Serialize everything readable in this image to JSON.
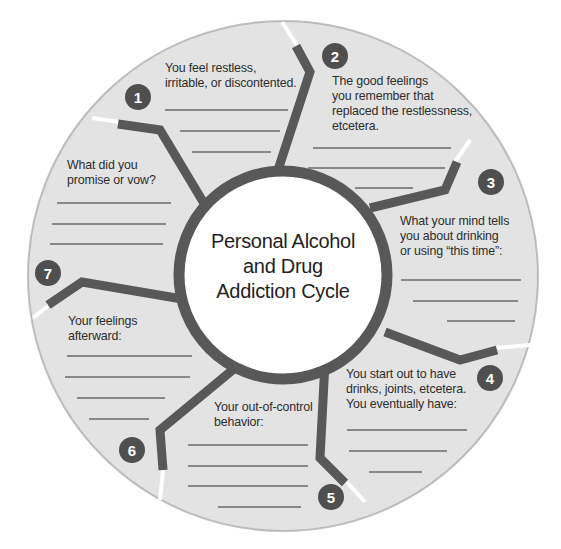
{
  "title": "Personal Alcohol\nand Drug\nAddiction Cycle",
  "colors": {
    "segment_fill": "#e3e3e3",
    "divider": "#585858",
    "badge": "#4f4f4f",
    "center": "#ffffff"
  },
  "segments": [
    {
      "number": "1",
      "prompt": "You feel restless,\nirritable, or discontented.",
      "blank_lines": 3
    },
    {
      "number": "2",
      "prompt": "The good feelings\nyou remember that\nreplaced the restlessness,\netcetera.",
      "blank_lines": 3
    },
    {
      "number": "3",
      "prompt": "What your mind tells\nyou about drinking\nor using “this time”:",
      "blank_lines": 3
    },
    {
      "number": "4",
      "prompt": "You start out to have\ndrinks, joints, etcetera.\nYou eventually have:",
      "blank_lines": 3
    },
    {
      "number": "5",
      "prompt": "Your out-of-control\nbehavior:",
      "blank_lines": 4
    },
    {
      "number": "6",
      "prompt": "Your feelings\nafterward:",
      "blank_lines": 4
    },
    {
      "number": "7",
      "prompt": "What did you\npromise or vow?",
      "blank_lines": 3
    }
  ]
}
